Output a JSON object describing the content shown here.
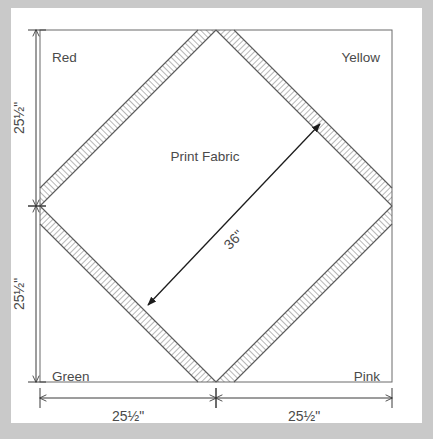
{
  "diagram": {
    "type": "quilt-block-schematic",
    "center_label": "Print Fabric",
    "diagonal_label": "36\"",
    "corners": [
      {
        "id": "top-left",
        "label": "Red"
      },
      {
        "id": "top-right",
        "label": "Yellow"
      },
      {
        "id": "bottom-left",
        "label": "Green"
      },
      {
        "id": "bottom-right",
        "label": "Pink"
      }
    ],
    "dimensions": [
      {
        "id": "left-upper",
        "label": "25½\"",
        "orientation": "vertical"
      },
      {
        "id": "left-lower",
        "label": "25½\"",
        "orientation": "vertical"
      },
      {
        "id": "bottom-left",
        "label": "25½\"",
        "orientation": "horizontal"
      },
      {
        "id": "bottom-right",
        "label": "25½\"",
        "orientation": "horizontal"
      }
    ],
    "colors": {
      "page_background": "#c9c9c9",
      "canvas_background": "#ffffff",
      "line": "#3a3a3a",
      "hatch": "#555555",
      "text": "#4a4a4a"
    }
  }
}
